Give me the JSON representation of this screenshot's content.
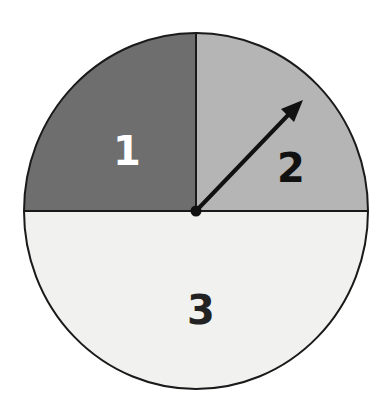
{
  "spinner": {
    "center": [
      196,
      211
    ],
    "radius_x": 172,
    "radius_y": 178,
    "sections": [
      {
        "label": "1",
        "fraction": 0.25,
        "position": "top-left",
        "fill": "#6e6e6e",
        "text_color": "#ffffff"
      },
      {
        "label": "2",
        "fraction": 0.25,
        "position": "top-right",
        "fill": "#b5b5b5",
        "text_color": "#111111"
      },
      {
        "label": "3",
        "fraction": 0.5,
        "position": "bottom-half",
        "fill": "#f1f1ef",
        "text_color": "#222222"
      }
    ],
    "arrow": {
      "from": [
        196,
        211
      ],
      "to": [
        302,
        101
      ],
      "color": "#111111",
      "points_to_section": "2"
    },
    "outline_color": "#1a1a1a"
  }
}
